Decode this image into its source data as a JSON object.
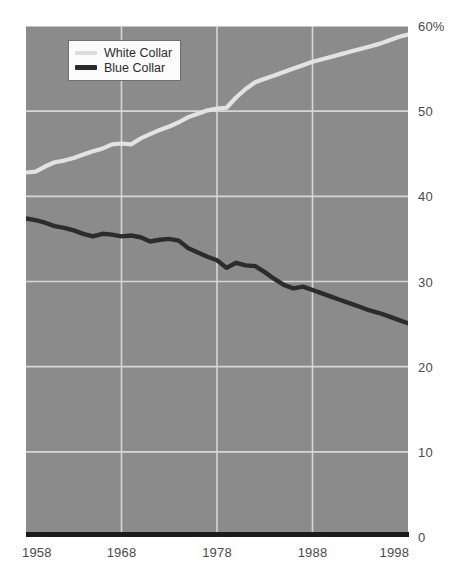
{
  "chart_data": {
    "type": "line",
    "title": "",
    "subtitle": "",
    "xlabel": "",
    "ylabel": "",
    "xlim": [
      1958,
      1998
    ],
    "ylim": [
      0,
      60
    ],
    "grid": true,
    "legend_position": "top-left-inside",
    "y_ticks": [
      {
        "value": 60,
        "label": "60%"
      },
      {
        "value": 50,
        "label": "50"
      },
      {
        "value": 40,
        "label": "40"
      },
      {
        "value": 30,
        "label": "30"
      },
      {
        "value": 20,
        "label": "20"
      },
      {
        "value": 10,
        "label": "10"
      },
      {
        "value": 0,
        "label": "0"
      }
    ],
    "x_ticks": [
      {
        "value": 1958,
        "label": "1958"
      },
      {
        "value": 1968,
        "label": "1968"
      },
      {
        "value": 1978,
        "label": "1978"
      },
      {
        "value": 1988,
        "label": "1988"
      },
      {
        "value": 1998,
        "label": "1998"
      }
    ],
    "x": [
      1958,
      1959,
      1960,
      1961,
      1962,
      1963,
      1964,
      1965,
      1966,
      1967,
      1968,
      1969,
      1970,
      1971,
      1972,
      1973,
      1974,
      1975,
      1976,
      1977,
      1978,
      1979,
      1980,
      1981,
      1982,
      1983,
      1984,
      1985,
      1986,
      1987,
      1988,
      1989,
      1990,
      1991,
      1992,
      1993,
      1994,
      1995,
      1996,
      1997,
      1998
    ],
    "series": [
      {
        "name": "White Collar",
        "color": "#e3e3e3",
        "values": [
          42.8,
          42.9,
          43.5,
          44.0,
          44.2,
          44.5,
          44.9,
          45.3,
          45.6,
          46.1,
          46.2,
          46.1,
          46.8,
          47.3,
          47.8,
          48.2,
          48.7,
          49.3,
          49.7,
          50.1,
          50.3,
          50.4,
          51.6,
          52.6,
          53.4,
          53.8,
          54.2,
          54.6,
          55.0,
          55.4,
          55.8,
          56.1,
          56.4,
          56.7,
          57.0,
          57.3,
          57.6,
          57.9,
          58.3,
          58.7,
          59.0
        ]
      },
      {
        "name": "Blue Collar",
        "color": "#2c2c2c",
        "values": [
          37.4,
          37.2,
          36.9,
          36.5,
          36.3,
          36.0,
          35.6,
          35.3,
          35.6,
          35.5,
          35.3,
          35.4,
          35.2,
          34.7,
          34.9,
          35.0,
          34.8,
          33.9,
          33.4,
          32.9,
          32.5,
          31.6,
          32.2,
          31.9,
          31.8,
          31.1,
          30.3,
          29.6,
          29.2,
          29.4,
          29.0,
          28.6,
          28.2,
          27.8,
          27.4,
          27.0,
          26.6,
          26.3,
          25.9,
          25.5,
          25.1
        ]
      }
    ]
  },
  "legend": {
    "items": [
      {
        "label": "White Collar",
        "swatch": "white-collar"
      },
      {
        "label": "Blue Collar",
        "swatch": "blue-collar"
      }
    ]
  },
  "colors": {
    "plot_background": "#8b8b8b",
    "gridline": "#d7d7d7",
    "axis_rule": "#1b1b1b",
    "tick_text": "#4a4a4a",
    "white_collar": "#e3e3e3",
    "blue_collar": "#2c2c2c",
    "legend_background": "#fbfbfb",
    "legend_border": "#707070"
  }
}
